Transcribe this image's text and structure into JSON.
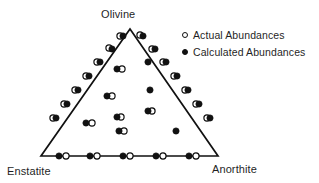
{
  "figure": {
    "type": "ternary-scatter-diagram",
    "background_color": "#ffffff",
    "line_color": "#111111"
  },
  "vertices": {
    "top": "Olivine",
    "bottom_left": "Enstatite",
    "bottom_right": "Anorthite"
  },
  "legend": {
    "items": [
      {
        "marker": "open-circle",
        "label": "Actual Abundances"
      },
      {
        "marker": "filled-circle",
        "label": "Calculated Abundances"
      }
    ]
  },
  "chart_data": {
    "type": "scatter",
    "title": "",
    "xlabel": "",
    "ylabel": "",
    "plot_shape": "ternary",
    "grid": false,
    "legend_position": "top-right",
    "axes": {
      "top_vertex": "Olivine",
      "left_vertex": "Enstatite",
      "right_vertex": "Anorthite"
    },
    "triangle_px": {
      "apex": [
        130,
        29
      ],
      "bottom_left": [
        41,
        156
      ],
      "bottom_right": [
        218,
        156
      ]
    },
    "series": [
      {
        "name": "Actual Abundances",
        "marker": "open-circle",
        "color": "#ffffff",
        "edge_color": "#111111",
        "points_px": [
          [
            120,
            36
          ],
          [
            140,
            35
          ],
          [
            109,
            48
          ],
          [
            152,
            49
          ],
          [
            97,
            62
          ],
          [
            163,
            62
          ],
          [
            86,
            76
          ],
          [
            174,
            76
          ],
          [
            75,
            90
          ],
          [
            185,
            90
          ],
          [
            64,
            104
          ],
          [
            196,
            104
          ],
          [
            53,
            118
          ],
          [
            207,
            118
          ],
          [
            66,
            156
          ],
          [
            97,
            156
          ],
          [
            130,
            156
          ],
          [
            163,
            156
          ],
          [
            196,
            156
          ],
          [
            122,
            69
          ],
          [
            112,
            96
          ],
          [
            121,
            117
          ],
          [
            124,
            131
          ],
          [
            92,
            123
          ],
          [
            152,
            111
          ]
        ]
      },
      {
        "name": "Calculated Abundances",
        "marker": "filled-circle",
        "color": "#111111",
        "edge_color": "#111111",
        "points_px": [
          [
            123,
            36
          ],
          [
            143,
            36
          ],
          [
            112,
            49
          ],
          [
            155,
            49
          ],
          [
            100,
            62
          ],
          [
            166,
            62
          ],
          [
            89,
            76
          ],
          [
            177,
            76
          ],
          [
            78,
            90
          ],
          [
            188,
            90
          ],
          [
            67,
            104
          ],
          [
            199,
            104
          ],
          [
            56,
            118
          ],
          [
            210,
            118
          ],
          [
            59,
            156
          ],
          [
            90,
            156
          ],
          [
            123,
            156
          ],
          [
            156,
            156
          ],
          [
            189,
            156
          ],
          [
            117,
            69
          ],
          [
            148,
            62
          ],
          [
            107,
            96
          ],
          [
            117,
            117
          ],
          [
            119,
            131
          ],
          [
            86,
            123
          ],
          [
            148,
            111
          ],
          [
            150,
            90
          ],
          [
            176,
            131
          ]
        ]
      }
    ]
  }
}
